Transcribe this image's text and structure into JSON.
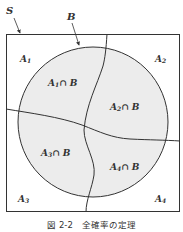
{
  "figure": {
    "caption": "図 2-2　全確率の定理",
    "labels": {
      "sample_space": "S",
      "event_b": "B",
      "a1": "A",
      "a1_sub": "1",
      "a2": "A",
      "a2_sub": "2",
      "a3": "A",
      "a3_sub": "3",
      "a4": "A",
      "a4_sub": "4",
      "a1b": "A",
      "a1b_sub": "1",
      "a1b_rest": "∩ B",
      "a2b": "A",
      "a2b_sub": "2",
      "a2b_rest": "∩ B",
      "a3b": "A",
      "a3b_sub": "3",
      "a3b_rest": "∩ B",
      "a4b": "A",
      "a4b_sub": "4",
      "a4b_rest": "∩ B"
    },
    "colors": {
      "line": "#333333",
      "circle_fill": "#ececec",
      "background": "#ffffff"
    }
  }
}
